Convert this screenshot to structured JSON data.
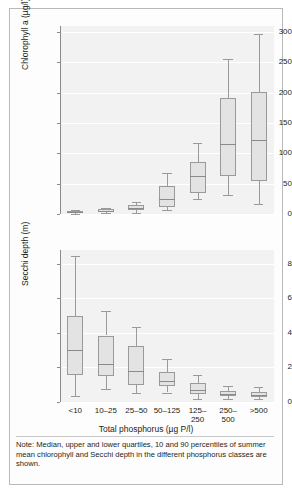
{
  "figure": {
    "note": "Note: Median, upper and lower quartiles, 10 and 90 percentiles of summer mean chlorophyll and Secchi depth in the different phosphorus classes are shown."
  },
  "axis": {
    "x_title": "Total phosphorus (µg P/l)",
    "x_categories": [
      "<10",
      "10–25",
      "25–50",
      "50–125",
      "125–\n250",
      "250–\n500",
      ">500"
    ]
  },
  "chart_data": [
    {
      "type": "box",
      "id": "chlorophyll",
      "title": "",
      "xlabel": "Total phosphorus (µg P/l)",
      "ylabel": "Chlorophyll a (µg/l)",
      "ylim": [
        0,
        310
      ],
      "yticks": [
        0,
        50,
        100,
        150,
        200,
        250,
        300
      ],
      "ytick_labels": [
        "0",
        "50",
        "100",
        "150",
        "200",
        "250",
        "300"
      ],
      "grid": true,
      "categories": [
        "<10",
        "10–25",
        "25–50",
        "50–125",
        "125–250",
        "250–500",
        ">500"
      ],
      "boxes": [
        {
          "category": "<10",
          "p10": 0.5,
          "q1": 1.5,
          "median": 2.5,
          "q3": 4.5,
          "p90": 6.5
        },
        {
          "category": "10–25",
          "p10": 1.5,
          "q1": 3.5,
          "median": 5.5,
          "q3": 7.5,
          "p90": 10.0
        },
        {
          "category": "25–50",
          "p10": 2.0,
          "q1": 7.0,
          "median": 10.0,
          "q3": 14.5,
          "p90": 20.0
        },
        {
          "category": "50–125",
          "p10": 7.0,
          "q1": 12.0,
          "median": 25.0,
          "q3": 46.0,
          "p90": 67.0
        },
        {
          "category": "125–250",
          "p10": 24.0,
          "q1": 34.0,
          "median": 62.0,
          "q3": 85.0,
          "p90": 117.0
        },
        {
          "category": "250–500",
          "p10": 31.0,
          "q1": 63.0,
          "median": 116.0,
          "q3": 191.0,
          "p90": 256.0
        },
        {
          "category": ">500",
          "p10": 17.0,
          "q1": 54.0,
          "median": 122.0,
          "q3": 201.0,
          "p90": 297.0
        }
      ]
    },
    {
      "type": "box",
      "id": "secchi",
      "title": "",
      "xlabel": "Total phosphorus (µg P/l)",
      "ylabel": "Secchi depth (m)",
      "ylim": [
        0,
        8.8
      ],
      "yticks": [
        0,
        2,
        4,
        6,
        8
      ],
      "ytick_labels": [
        "0",
        "2",
        "4",
        "6",
        "8"
      ],
      "grid": true,
      "categories": [
        "<10",
        "10–25",
        "25–50",
        "50–125",
        "125–250",
        "250–500",
        ">500"
      ],
      "boxes": [
        {
          "category": "<10",
          "p10": 0.35,
          "q1": 1.55,
          "median": 3.0,
          "q3": 5.0,
          "p90": 8.45
        },
        {
          "category": "10–25",
          "p10": 0.75,
          "q1": 1.5,
          "median": 2.2,
          "q3": 3.85,
          "p90": 5.25
        },
        {
          "category": "25–50",
          "p10": 0.5,
          "q1": 1.0,
          "median": 1.78,
          "q3": 3.25,
          "p90": 4.35
        },
        {
          "category": "50–125",
          "p10": 0.55,
          "q1": 0.9,
          "median": 1.22,
          "q3": 1.72,
          "p90": 2.5
        },
        {
          "category": "125–250",
          "p10": 0.2,
          "q1": 0.45,
          "median": 0.68,
          "q3": 1.1,
          "p90": 1.55
        },
        {
          "category": "250–500",
          "p10": 0.18,
          "q1": 0.35,
          "median": 0.48,
          "q3": 0.62,
          "p90": 0.92
        },
        {
          "category": ">500",
          "p10": 0.18,
          "q1": 0.3,
          "median": 0.42,
          "q3": 0.58,
          "p90": 0.85
        }
      ]
    }
  ]
}
